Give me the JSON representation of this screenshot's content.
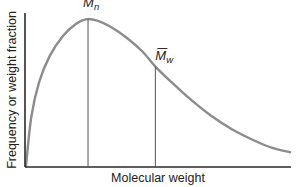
{
  "chart_data": {
    "type": "line",
    "title": "",
    "xlabel": "Molecular weight",
    "ylabel": "Frequency or weight fraction",
    "grid": false,
    "legend": "none",
    "x_ticks": [],
    "y_ticks": [],
    "xlim": [
      0,
      1
    ],
    "ylim": [
      0,
      1
    ],
    "series": [
      {
        "name": "molecular weight distribution",
        "x": [
          0.0,
          0.02,
          0.05,
          0.09,
          0.14,
          0.19,
          0.23,
          0.27,
          0.32,
          0.38,
          0.44,
          0.49,
          0.55,
          0.62,
          0.7,
          0.78,
          0.86,
          0.93,
          1.0
        ],
        "y": [
          0.0,
          0.32,
          0.55,
          0.72,
          0.85,
          0.93,
          0.96,
          0.95,
          0.91,
          0.84,
          0.75,
          0.65,
          0.55,
          0.44,
          0.33,
          0.24,
          0.17,
          0.12,
          0.09
        ]
      }
    ],
    "annotations": [
      {
        "label": "M",
        "subscript": "n",
        "overbar": true,
        "x": 0.235,
        "y": 0.96,
        "meaning": "number-average molecular weight (peak)"
      },
      {
        "label": "M",
        "subscript": "w",
        "overbar": true,
        "x": 0.49,
        "y": 0.65,
        "meaning": "weight-average molecular weight"
      }
    ]
  }
}
